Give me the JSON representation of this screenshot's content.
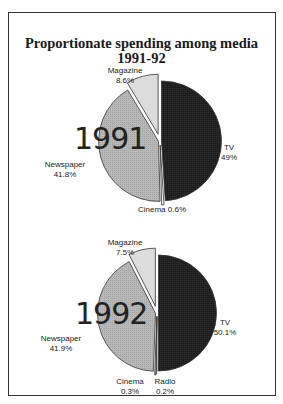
{
  "chart_data": [
    {
      "type": "pie",
      "title": "Proportionate spending among media 1991-92",
      "label": "1991",
      "categories": [
        "TV",
        "Cinema",
        "Newspaper",
        "Magazine"
      ],
      "values": [
        49,
        0.6,
        41.8,
        8.6
      ],
      "value_labels": [
        "49%",
        "0.6%",
        "41.8%",
        "8.6%"
      ],
      "colors": [
        "#1c1c1c",
        "#ffffff",
        "#b4b4b4",
        "#dcdcdc"
      ],
      "exploded": [
        "Magazine",
        "Cinema"
      ]
    },
    {
      "type": "pie",
      "title": "Proportionate spending among media 1991-92",
      "label": "1992",
      "categories": [
        "TV",
        "Radio",
        "Cinema",
        "Newspaper",
        "Magazine"
      ],
      "values": [
        50.1,
        0.2,
        0.3,
        41.9,
        7.5
      ],
      "value_labels": [
        "50.1%",
        "0.2%",
        "0.3%",
        "41.9%",
        "7.5%"
      ],
      "colors": [
        "#1c1c1c",
        "#ffffff",
        "#ffffff",
        "#b4b4b4",
        "#dcdcdc"
      ],
      "exploded": [
        "Magazine",
        "Radio",
        "Cinema"
      ]
    }
  ],
  "title_line1": "Proportionate spending among media",
  "title_line2": "1991-92",
  "pie1": {
    "year": "1991",
    "magazine_name": "Magazine",
    "magazine_val": "8.6%",
    "tv_name": "TV",
    "tv_val": "49%",
    "newspaper_name": "Newspaper",
    "newspaper_val": "41.8%",
    "cinema_label": "Cinema 0.6%"
  },
  "pie2": {
    "year": "1992",
    "magazine_name": "Magazine",
    "magazine_val": "7.5%",
    "tv_name": "TV",
    "tv_val": "50.1%",
    "newspaper_name": "Newspaper",
    "newspaper_val": "41.9%",
    "cinema_name": "Cinema",
    "cinema_val": "0.3%",
    "radio_name": "Radio",
    "radio_val": "0.2%"
  }
}
